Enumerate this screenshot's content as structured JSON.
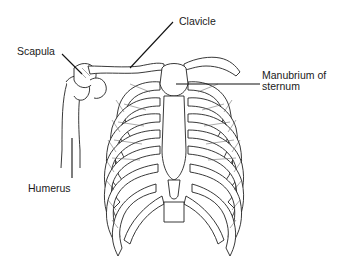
{
  "figure": {
    "labels": [
      {
        "id": "scapula",
        "text": "Scapula"
      },
      {
        "id": "clavicle",
        "text": "Clavicle"
      },
      {
        "id": "manubrium",
        "text": "Manubrium of\nsternum",
        "line1": "Manubrium of",
        "line2": "sternum"
      },
      {
        "id": "humerus",
        "text": "Humerus"
      }
    ]
  },
  "colors": {
    "background": "#ffffff",
    "line": "#222222",
    "text": "#1a1a1a"
  }
}
